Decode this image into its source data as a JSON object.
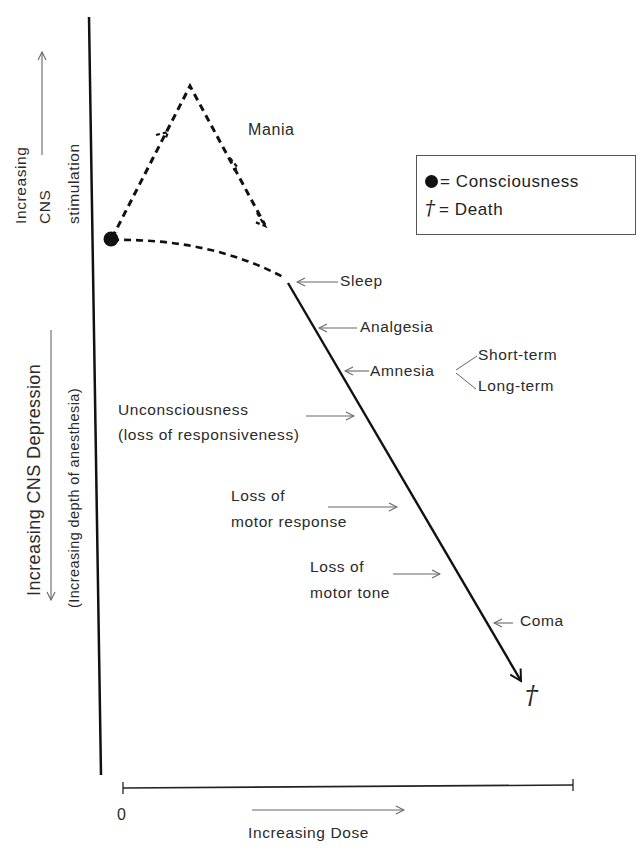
{
  "diagram": {
    "title": "",
    "y_axis": {
      "upper_label_line1": "Increasing",
      "upper_label_line2": "CNS",
      "upper_label_line3": "stimulation",
      "lower_label_main": "Increasing CNS Depression",
      "lower_label_sub": "(Increasing depth of anesthesia)"
    },
    "x_axis": {
      "origin_label": "0",
      "label": "Increasing Dose"
    },
    "legend": {
      "consciousness_symbol": "●",
      "consciousness_label": "= Consciousness",
      "death_symbol": "†",
      "death_label": "= Death"
    },
    "stimulation_branch": {
      "label": "Mania"
    },
    "depression_stages": [
      {
        "label": "Sleep"
      },
      {
        "label": "Analgesia"
      },
      {
        "label": "Amnesia",
        "subtypes": [
          "Short-term",
          "Long-term"
        ]
      },
      {
        "label_line1": "Unconsciousness",
        "label_line2": "(loss of responsiveness)"
      },
      {
        "label_line1": "Loss of",
        "label_line2": "motor response"
      },
      {
        "label_line1": "Loss of",
        "label_line2": "motor tone"
      },
      {
        "label": "Coma"
      }
    ],
    "endpoint_symbol": "†",
    "colors": {
      "line": "#111111",
      "pointer": "#666666",
      "text": "#2a2a2a"
    }
  }
}
